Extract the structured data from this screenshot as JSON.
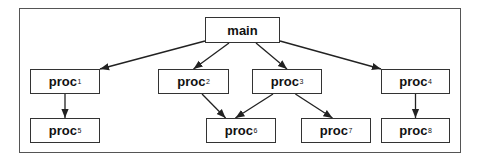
{
  "diagram": {
    "type": "call-graph",
    "colors": {
      "border": "#333333",
      "frame": "#555555",
      "edge": "#222222",
      "background": "#ffffff"
    },
    "nodes": [
      {
        "id": "main",
        "base": "main",
        "sub": "",
        "x": 205,
        "y": 17,
        "w": 75,
        "h": 26
      },
      {
        "id": "proc1",
        "base": "proc",
        "sub": "1",
        "x": 30,
        "y": 69,
        "w": 70,
        "h": 25
      },
      {
        "id": "proc2",
        "base": "proc",
        "sub": "2",
        "x": 158,
        "y": 69,
        "w": 71,
        "h": 25
      },
      {
        "id": "proc3",
        "base": "proc",
        "sub": "3",
        "x": 252,
        "y": 69,
        "w": 70,
        "h": 25
      },
      {
        "id": "proc4",
        "base": "proc",
        "sub": "4",
        "x": 381,
        "y": 69,
        "w": 69,
        "h": 25
      },
      {
        "id": "proc5",
        "base": "proc",
        "sub": "5",
        "x": 30,
        "y": 118,
        "w": 70,
        "h": 25
      },
      {
        "id": "proc6",
        "base": "proc",
        "sub": "6",
        "x": 206,
        "y": 118,
        "w": 70,
        "h": 25
      },
      {
        "id": "proc7",
        "base": "proc",
        "sub": "7",
        "x": 301,
        "y": 118,
        "w": 70,
        "h": 25
      },
      {
        "id": "proc8",
        "base": "proc",
        "sub": "8",
        "x": 381,
        "y": 118,
        "w": 69,
        "h": 25
      }
    ],
    "edges": [
      {
        "from": "main",
        "to": "proc1"
      },
      {
        "from": "main",
        "to": "proc2"
      },
      {
        "from": "main",
        "to": "proc3"
      },
      {
        "from": "main",
        "to": "proc4"
      },
      {
        "from": "proc1",
        "to": "proc5"
      },
      {
        "from": "proc2",
        "to": "proc6"
      },
      {
        "from": "proc3",
        "to": "proc6"
      },
      {
        "from": "proc3",
        "to": "proc7"
      },
      {
        "from": "proc4",
        "to": "proc8"
      }
    ]
  }
}
